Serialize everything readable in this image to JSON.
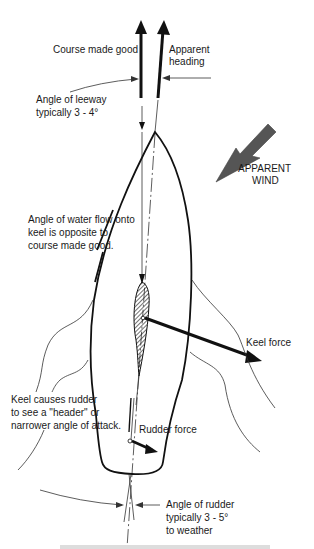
{
  "diagram": {
    "labels": {
      "course_made_good": "Course made good",
      "apparent_heading_line1": "Apparent",
      "apparent_heading_line2": "heading",
      "leeway_line1": "Angle of leeway",
      "leeway_line2": "typically 3 - 4°",
      "wind_line1": "APPARENT",
      "wind_line2": "WIND",
      "water_flow_line1": "Angle of water flow onto",
      "water_flow_line2": "keel is opposite to",
      "water_flow_line3": "course made good.",
      "keel_force": "Keel force",
      "header_line1": "Keel causes rudder",
      "header_line2": "to see a \"header\" or",
      "header_line3": "narrower angle of attack.",
      "rudder_force": "Rudder force",
      "rudder_angle_line1": "Angle of rudder",
      "rudder_angle_line2": "typically  3 - 5°",
      "rudder_angle_line3": "to weather"
    },
    "colors": {
      "ink": "#111111",
      "wind_arrow": "#555555",
      "background": "#ffffff"
    }
  }
}
